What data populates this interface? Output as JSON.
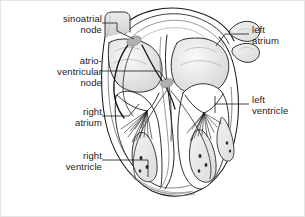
{
  "figure": {
    "background_color": "#ffffff",
    "border_color": "#e6e6e6",
    "ink_color": "#1a1a1a",
    "node_fill_color": "#b3b3b3",
    "shade_color": "#d9d9d9"
  },
  "labels": {
    "sinoatrial_node": "sinoatrial\nnode",
    "atrioventricular_node": "atrio-\nventricular\nnode",
    "right_atrium": "right\natrium",
    "right_ventricle": "right\nventricle",
    "left_atrium": "left\natrium",
    "left_ventricle": "left\nventricle"
  },
  "structures": [
    {
      "name": "sinoatrial-node",
      "side": "left",
      "type": "node"
    },
    {
      "name": "atrioventricular-node",
      "side": "left",
      "type": "node"
    },
    {
      "name": "right-atrium",
      "side": "left",
      "type": "chamber"
    },
    {
      "name": "right-ventricle",
      "side": "left",
      "type": "chamber"
    },
    {
      "name": "left-atrium",
      "side": "right",
      "type": "chamber"
    },
    {
      "name": "left-ventricle",
      "side": "right",
      "type": "chamber"
    },
    {
      "name": "aortic-arch",
      "side": "top",
      "type": "vessel"
    },
    {
      "name": "pulmonary-veins",
      "side": "right",
      "type": "vessel"
    },
    {
      "name": "superior-vena-cava",
      "side": "left",
      "type": "vessel"
    },
    {
      "name": "purkinje-fibers",
      "side": "both",
      "type": "fibers"
    },
    {
      "name": "papillary-muscles",
      "side": "both",
      "type": "muscle"
    },
    {
      "name": "chordae-tendineae",
      "side": "both",
      "type": "fibers"
    }
  ]
}
